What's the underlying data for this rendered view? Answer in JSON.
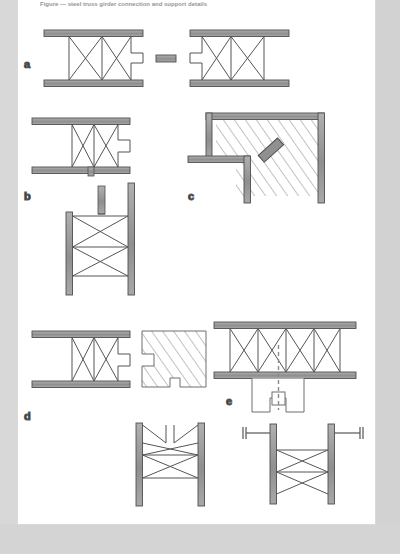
{
  "document": {
    "type": "technical-figure",
    "caption_top": "Figure — steel truss girder connection and support details",
    "background_color": "#ffffff",
    "page_margin_color": "#d8d8d8",
    "line_color": "#555555",
    "member_fill": "#9a9a9a",
    "hatch_color": "#8a8a8a"
  },
  "panels": [
    {
      "id": "a",
      "label": "a",
      "description": "Two opposing truss girder ends separated by a short splice plate",
      "elements": [
        "truss-left",
        "splice-plate",
        "truss-right"
      ]
    },
    {
      "id": "b",
      "label": "b",
      "description": "Truss girder end seated on a column with vertical post above",
      "elements": [
        "truss-horizontal",
        "column-vertical",
        "truss-vertical-braced"
      ]
    },
    {
      "id": "c",
      "label": "c",
      "description": "L-shaped corner bracket against hatched wall section with diagonal anchor bar",
      "elements": [
        "corner-angle",
        "hatched-wall",
        "diagonal-anchor-bar"
      ]
    },
    {
      "id": "d",
      "label": "d",
      "description": "Truss girder adjacent to hatched notched masonry block; braced truss post below",
      "elements": [
        "truss-horizontal",
        "hatched-notched-block",
        "truss-post-braced"
      ]
    },
    {
      "id": "e",
      "label": "e",
      "description": "Multi-panel truss over a stepped bearing pad with dashed centerline; anchored truss post below",
      "elements": [
        "truss-multipanel",
        "dashed-centerline",
        "stepped-bearing-pad",
        "truss-post-with-anchors"
      ]
    }
  ],
  "legend": {
    "member_label": "steel member",
    "hatch_label": "masonry / concrete",
    "centerline_label": "centerline"
  }
}
